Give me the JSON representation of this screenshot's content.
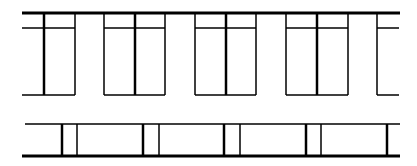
{
  "diagram": {
    "stroke_color": "#000000",
    "background": "#ffffff",
    "upper_row": {
      "top_line_y": 13,
      "transom_y": 28,
      "bottom_y": 95,
      "windows": [
        {
          "x1": 23,
          "xm": 44,
          "x2": 75,
          "type": "single"
        },
        {
          "x1": 104,
          "xm": 135,
          "x2": 165,
          "type": "double"
        },
        {
          "x1": 195,
          "xm": 226,
          "x2": 256,
          "type": "double"
        },
        {
          "x1": 286,
          "xm": 317,
          "x2": 348,
          "type": "double"
        },
        {
          "x1": 377,
          "xm": null,
          "x2": 399,
          "type": "partial"
        }
      ]
    },
    "lower_strip": {
      "top_y": 124,
      "bottom_y": 156,
      "posts": [
        {
          "thick_x": 62,
          "thin_x": 77
        },
        {
          "thick_x": 143,
          "thin_x": 159
        },
        {
          "thick_x": 224,
          "thin_x": 240
        },
        {
          "thick_x": 306,
          "thin_x": 321
        },
        {
          "thick_x": 387,
          "thin_x": null
        }
      ]
    }
  }
}
